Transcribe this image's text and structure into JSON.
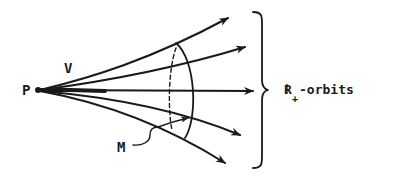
{
  "diagram": {
    "labels": {
      "point": "P",
      "cone": "V",
      "section": "M",
      "orbits_main": "R",
      "orbits_sub": "+",
      "orbits_suffix": "-orbits"
    },
    "orbit_count": 5,
    "colors": {
      "ink": "#1a1a1a",
      "background": "#ffffff"
    }
  }
}
